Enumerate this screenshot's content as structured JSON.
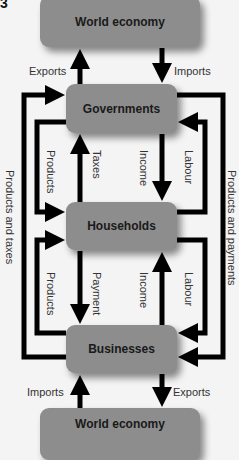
{
  "figure_label": "3",
  "nodes": {
    "world_top": "World economy",
    "governments": "Governments",
    "households": "Households",
    "businesses": "Businesses",
    "world_bottom": "World economy"
  },
  "labels": {
    "exports_top": "Exports",
    "imports_top": "Imports",
    "products_gov_hh": "Products",
    "taxes": "Taxes",
    "income_gov_hh": "Income",
    "labour_hh_gov": "Labour",
    "products_bus_hh": "Products",
    "payment": "Payment",
    "income_bus_hh": "Income",
    "labour_hh_bus": "Labour",
    "products_and_taxes": "Products and taxes",
    "products_and_payments": "Products and payments",
    "imports_bottom": "Imports",
    "exports_bottom": "Exports"
  },
  "colors": {
    "node_fill": "#8d8d8d",
    "arrow": "#000000",
    "background": "#f4f4f4"
  }
}
